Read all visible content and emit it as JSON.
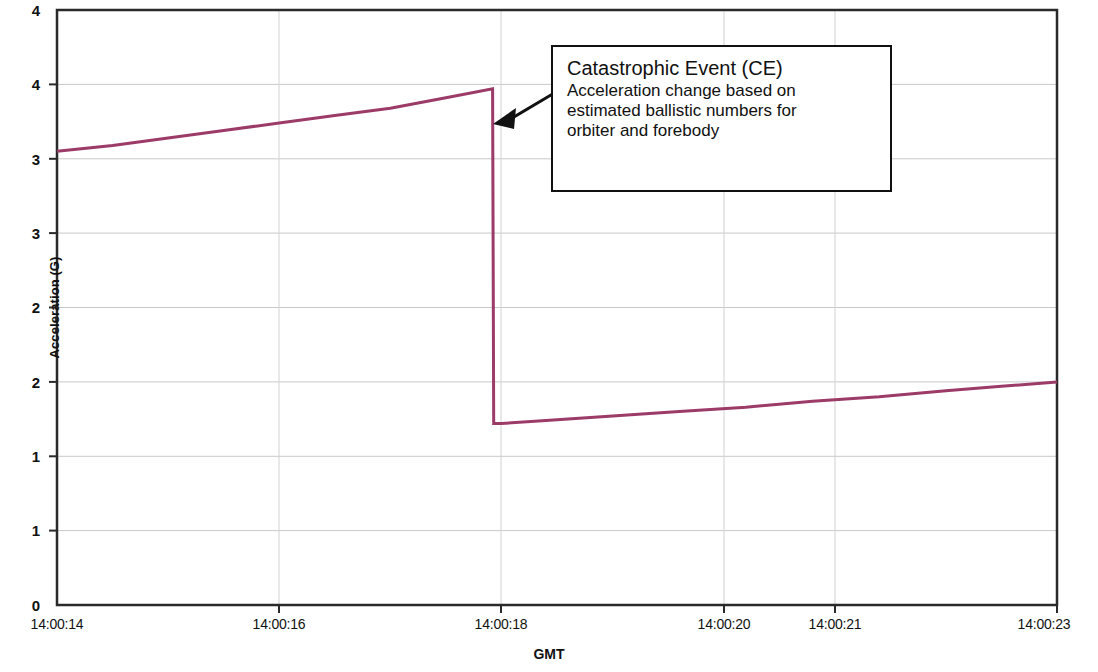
{
  "chart_data": {
    "type": "line",
    "title": "",
    "xlabel": "GMT",
    "ylabel": "Acceleration (G)",
    "xtick_labels": [
      "14:00:14",
      "14:00:16",
      "14:00:18",
      "14:00:20",
      "14:00:21",
      "14:00:23"
    ],
    "xtick_positions": [
      14,
      16,
      18,
      20,
      21,
      23
    ],
    "xlim": [
      14,
      23
    ],
    "ytick_labels": [
      "4",
      "4",
      "3",
      "3",
      "2",
      "2",
      "1",
      "1",
      "0"
    ],
    "ytick_values": [
      4.0,
      3.5,
      3.0,
      2.5,
      2.0,
      1.5,
      1.0,
      0.5,
      0.0
    ],
    "ylim": [
      0,
      4
    ],
    "grid": true,
    "grid_color": "#c8c8c8",
    "line_color": "#9c3a68",
    "line_width": 3,
    "series": [
      {
        "name": "Acceleration",
        "x": [
          14.0,
          14.5,
          15.0,
          15.5,
          16.0,
          16.5,
          17.0,
          17.5,
          17.92,
          17.93,
          18.0,
          18.4,
          19.0,
          19.6,
          20.2,
          20.8,
          21.4,
          22.0,
          22.5,
          23.0
        ],
        "y": [
          3.05,
          3.09,
          3.14,
          3.19,
          3.24,
          3.29,
          3.34,
          3.41,
          3.47,
          1.22,
          1.22,
          1.24,
          1.27,
          1.3,
          1.33,
          1.37,
          1.4,
          1.44,
          1.47,
          1.5
        ]
      }
    ],
    "annotations": [
      {
        "name": "catastrophic-event-callout",
        "title": "Catastrophic Event (CE)",
        "lines": [
          "Acceleration change based on",
          "estimated ballistic numbers for",
          "orbiter and forebody"
        ],
        "arrow_target_x": 17.92,
        "arrow_target_y": 3.47
      }
    ]
  }
}
